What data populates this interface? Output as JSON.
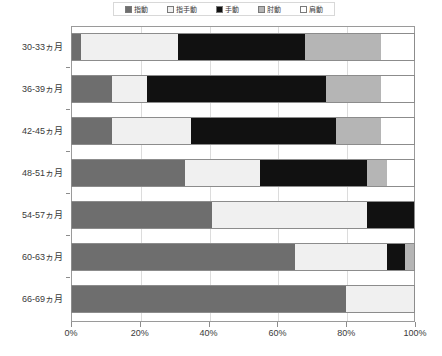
{
  "chart_data": {
    "type": "bar",
    "orientation": "horizontal",
    "stacked": true,
    "normalized": true,
    "title": "",
    "xlabel": "",
    "ylabel": "",
    "xlim": [
      0,
      100
    ],
    "grid": true,
    "legend_position": "top",
    "categories": [
      "30-33ヵ月",
      "36-39ヵ月",
      "42-45ヵ月",
      "48-51ヵ月",
      "54-57ヵ月",
      "60-63ヵ月",
      "66-69ヵ月"
    ],
    "tick_labels": [
      "0%",
      "20%",
      "40%",
      "60%",
      "80%",
      "100%"
    ],
    "tick_values": [
      0,
      20,
      40,
      60,
      80,
      100
    ],
    "series": [
      {
        "name": "指動",
        "color": "#6e6e6e",
        "values": [
          3,
          12,
          12,
          33,
          41,
          65,
          80
        ]
      },
      {
        "name": "指手動",
        "color": "#f0f0f0",
        "values": [
          28,
          10,
          23,
          22,
          45,
          27,
          20
        ]
      },
      {
        "name": "手動",
        "color": "#111111",
        "values": [
          37,
          52,
          42,
          31,
          14,
          5,
          0
        ]
      },
      {
        "name": "肘動",
        "color": "#b5b5b5",
        "values": [
          22,
          16,
          13,
          6,
          0,
          3,
          0
        ]
      },
      {
        "name": "肩動",
        "color": "#ffffff",
        "values": [
          10,
          10,
          10,
          8,
          0,
          0,
          0
        ]
      }
    ]
  }
}
